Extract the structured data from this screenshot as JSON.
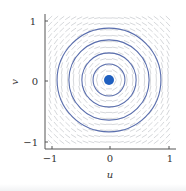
{
  "chart_data": {
    "type": "scatter",
    "title": "",
    "xlabel": "u",
    "ylabel": "v",
    "xlim": [
      -1.1,
      1.1
    ],
    "ylim": [
      -1.1,
      1.1
    ],
    "x_ticks": [
      -1,
      0,
      1
    ],
    "y_ticks": [
      -1,
      0,
      1
    ],
    "x_tick_labels": [
      "−1",
      "0",
      "1"
    ],
    "y_tick_labels": [
      "−1",
      "0",
      "1"
    ],
    "grid": false,
    "legend": null,
    "equilibrium_point": {
      "u": 0,
      "v": 0,
      "color": "#1f5fbf"
    },
    "level_curves": {
      "shape": "concentric circles centered at origin",
      "radii": [
        0.27,
        0.46,
        0.68,
        0.88
      ],
      "color": "#5b6fae"
    },
    "vector_field": {
      "description": "faint grey direction arrows on a grid, rotating around origin",
      "grid_spacing": 0.1,
      "color": "#c4c7cc"
    }
  },
  "axes": {
    "xlabel": "u",
    "ylabel": "v",
    "x_ticks": [
      {
        "label": "−1",
        "value": -1
      },
      {
        "label": "0",
        "value": 0
      },
      {
        "label": "1",
        "value": 1
      }
    ],
    "y_ticks": [
      {
        "label": "1",
        "value": 1
      },
      {
        "label": "0",
        "value": 0
      },
      {
        "label": "−1",
        "value": -1
      }
    ]
  },
  "colors": {
    "curve": "#5b6fae",
    "dot": "#1f5fbf",
    "arrow": "#c4c7cc",
    "axis": "#555555"
  }
}
